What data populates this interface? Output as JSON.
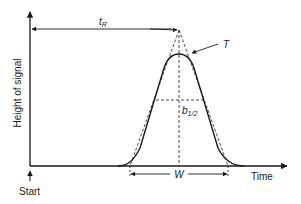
{
  "diagram": {
    "type": "chromatogram-peak",
    "labels": {
      "y_axis": "Height of signal",
      "x_axis": "Time",
      "start": "Start",
      "retention_time": "t",
      "retention_time_sub": "R",
      "tangent_point": "T",
      "half_width": "b",
      "half_width_sub": "1/2",
      "peak_width": "W"
    },
    "colors": {
      "line": "#1a1a1a",
      "background": "#ffffff"
    }
  }
}
